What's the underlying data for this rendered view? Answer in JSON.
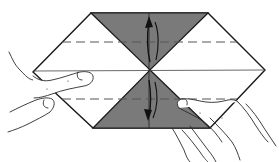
{
  "diagram": {
    "type": "origami-folding-step",
    "colors": {
      "paper": "#ffffff",
      "shaded_flap": "#7a7a7a",
      "line": "#1a1a1a",
      "dashed_fold": "#555555",
      "hand_outline": "#2a2a2a"
    },
    "paper_outline": {
      "vertices": [
        [
          91,
          13
        ],
        [
          208,
          13
        ],
        [
          265,
          70
        ],
        [
          210,
          128
        ],
        [
          93,
          128
        ],
        [
          33,
          72
        ]
      ]
    },
    "shaded_triangles": [
      {
        "name": "top-flap",
        "points": [
          [
            91,
            13
          ],
          [
            208,
            13
          ],
          [
            150,
            70
          ]
        ]
      },
      {
        "name": "bottom-flap",
        "points": [
          [
            150,
            70
          ],
          [
            210,
            128
          ],
          [
            93,
            128
          ]
        ]
      }
    ],
    "center_line": {
      "y": 70,
      "x1": 33,
      "x2": 265
    },
    "vertical_crease": {
      "x": 149,
      "y1": 13,
      "y2": 128
    },
    "fold_lines": [
      {
        "name": "upper-valley-fold",
        "y": 42,
        "x1": 62,
        "x2": 237
      },
      {
        "name": "lower-valley-fold",
        "y": 99,
        "x1": 62,
        "x2": 237
      }
    ],
    "arrows": [
      {
        "name": "upper-fold-arrow",
        "direction": "up"
      },
      {
        "name": "lower-fold-arrow",
        "direction": "down"
      }
    ],
    "hands": [
      {
        "name": "left-hand",
        "position": "left",
        "action": "pressing left point"
      },
      {
        "name": "right-hand",
        "position": "lower-right",
        "action": "lifting lower flap"
      }
    ]
  }
}
